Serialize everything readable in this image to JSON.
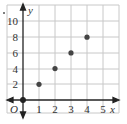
{
  "chart_data": {
    "type": "scatter",
    "title": "",
    "xlabel": "x",
    "ylabel": "y",
    "origin_label": "O",
    "x": [
      1,
      2,
      3,
      4
    ],
    "y": [
      2,
      4,
      6,
      8
    ],
    "series": [
      {
        "name": "points",
        "x": [
          1,
          2,
          3,
          4
        ],
        "y": [
          2,
          4,
          6,
          8
        ]
      }
    ],
    "xlim": [
      0,
      6
    ],
    "ylim": [
      0,
      12
    ],
    "x_ticks": [
      "1",
      "2",
      "3",
      "4",
      "5"
    ],
    "y_ticks": [
      "2",
      "4",
      "6",
      "8",
      "10"
    ],
    "grid": true,
    "legend": null
  },
  "colors": {
    "grid": "#c8c8c8",
    "axis": "#222222",
    "point": "#444444",
    "text": "#333333"
  }
}
